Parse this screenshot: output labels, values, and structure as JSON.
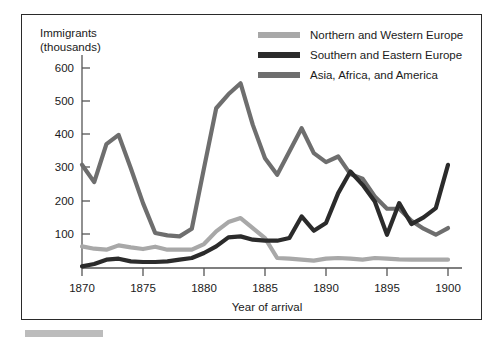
{
  "figure": {
    "footer_bar_color": "#bcbcbc",
    "frame_border_color": "#2a2a2a"
  },
  "axes": {
    "y_axis_title_line1": "Immigrants",
    "y_axis_title_line2": "(thousands)",
    "x_axis_title": "Year of arrival",
    "y_ticks": [
      "100",
      "200",
      "300",
      "400",
      "500",
      "600"
    ],
    "x_ticks": [
      "1870",
      "1875",
      "1880",
      "1885",
      "1890",
      "1895",
      "1900"
    ]
  },
  "legend": {
    "items": [
      {
        "label": "Northern and Western Europe",
        "color": "#a8a8a8"
      },
      {
        "label": "Southern and Eastern Europe",
        "color": "#2b2b2b"
      },
      {
        "label": "Asia, Africa, and America",
        "color": "#6e6e6e"
      }
    ]
  },
  "chart_data": {
    "type": "line",
    "title": "",
    "xlabel": "Year of arrival",
    "ylabel": "Immigrants (thousands)",
    "xlim": [
      1870,
      1900
    ],
    "ylim": [
      0,
      640
    ],
    "grid": false,
    "legend_position": "top-right",
    "x": [
      1870,
      1871,
      1872,
      1873,
      1874,
      1875,
      1876,
      1877,
      1878,
      1879,
      1880,
      1881,
      1882,
      1883,
      1884,
      1885,
      1886,
      1887,
      1888,
      1889,
      1890,
      1891,
      1892,
      1893,
      1894,
      1895,
      1896,
      1897,
      1898,
      1899,
      1900
    ],
    "series": [
      {
        "name": "Northern and Western Europe",
        "color": "#a8a8a8",
        "values": [
          65,
          58,
          55,
          68,
          62,
          57,
          64,
          55,
          55,
          55,
          72,
          110,
          138,
          150,
          120,
          90,
          30,
          28,
          25,
          22,
          28,
          30,
          28,
          25,
          30,
          28,
          26,
          25,
          25,
          25,
          25
        ]
      },
      {
        "name": "Southern and Eastern Europe",
        "color": "#2b2b2b",
        "values": [
          5,
          12,
          25,
          28,
          20,
          18,
          18,
          20,
          25,
          30,
          45,
          65,
          92,
          95,
          85,
          82,
          82,
          90,
          155,
          112,
          135,
          225,
          290,
          250,
          200,
          100,
          195,
          132,
          152,
          180,
          310
        ]
      },
      {
        "name": "Asia, Africa, and America",
        "color": "#6e6e6e",
        "values": [
          310,
          258,
          372,
          400,
          300,
          195,
          105,
          98,
          95,
          118,
          300,
          480,
          522,
          555,
          430,
          330,
          280,
          350,
          420,
          345,
          318,
          335,
          282,
          268,
          215,
          178,
          178,
          142,
          118,
          100,
          120
        ]
      }
    ]
  }
}
